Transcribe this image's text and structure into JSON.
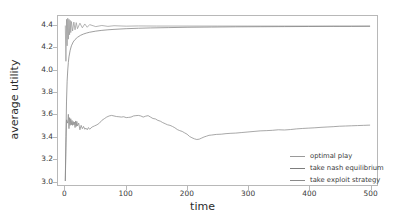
{
  "chart_data": {
    "type": "line",
    "title": "",
    "xlabel": "time",
    "ylabel": "average utility",
    "xlim": [
      -12,
      512
    ],
    "ylim": [
      2.96,
      4.49
    ],
    "xticks": [
      "0",
      "100",
      "200",
      "300",
      "400",
      "500"
    ],
    "xtick_values": [
      0,
      100,
      200,
      300,
      400,
      500
    ],
    "yticks": [
      "3.0",
      "3.2",
      "3.4",
      "3.6",
      "3.8",
      "4.0",
      "4.2",
      "4.4"
    ],
    "ytick_values": [
      3.0,
      3.2,
      3.4,
      3.6,
      3.8,
      4.0,
      4.2,
      4.4
    ],
    "grid": false,
    "legend_position": "lower right",
    "series": [
      {
        "name": "optimal play",
        "color": "#9a9a9a",
        "x": [
          0,
          1,
          2,
          3,
          4,
          5,
          6,
          7,
          8,
          9,
          10,
          12,
          14,
          16,
          18,
          20,
          24,
          28,
          32,
          36,
          40,
          50,
          60,
          70,
          80,
          100,
          120,
          150,
          200,
          250,
          300,
          350,
          400,
          450,
          500
        ],
        "y": [
          4.4,
          4.08,
          4.46,
          4.22,
          4.47,
          4.28,
          4.46,
          4.32,
          4.45,
          4.34,
          4.44,
          4.355,
          4.435,
          4.365,
          4.43,
          4.375,
          4.425,
          4.383,
          4.418,
          4.388,
          4.412,
          4.394,
          4.404,
          4.396,
          4.402,
          4.398,
          4.4,
          4.399,
          4.399,
          4.399,
          4.399,
          4.399,
          4.399,
          4.399,
          4.399
        ]
      },
      {
        "name": "take nash equilibrium",
        "color": "#7d7d7d",
        "x": [
          0,
          1,
          2,
          3,
          4,
          5,
          6,
          8,
          10,
          13,
          16,
          20,
          25,
          30,
          35,
          40,
          50,
          60,
          70,
          80,
          100,
          120,
          140,
          170,
          200,
          240,
          280,
          320,
          360,
          400,
          440,
          470,
          500
        ],
        "y": [
          3.0,
          3.4,
          3.72,
          3.9,
          4.0,
          4.07,
          4.12,
          4.18,
          4.22,
          4.255,
          4.277,
          4.297,
          4.315,
          4.327,
          4.336,
          4.343,
          4.353,
          4.36,
          4.365,
          4.369,
          4.375,
          4.379,
          4.382,
          4.385,
          4.388,
          4.39,
          4.392,
          4.393,
          4.394,
          4.395,
          4.396,
          4.396,
          4.397
        ]
      },
      {
        "name": "take exploit strategy",
        "color": "#8a8a8a",
        "x": [
          0,
          2,
          4,
          5,
          6,
          7,
          8,
          9,
          10,
          11,
          12,
          13,
          14,
          15,
          16,
          17,
          18,
          19,
          20,
          22,
          24,
          26,
          28,
          30,
          32,
          34,
          36,
          38,
          40,
          44,
          48,
          52,
          56,
          60,
          64,
          68,
          72,
          76,
          80,
          84,
          88,
          92,
          96,
          100,
          104,
          108,
          112,
          116,
          120,
          124,
          128,
          132,
          136,
          140,
          144,
          148,
          152,
          156,
          160,
          164,
          168,
          172,
          176,
          180,
          184,
          188,
          192,
          196,
          200,
          204,
          208,
          212,
          216,
          220,
          224,
          228,
          232,
          236,
          240,
          248,
          256,
          264,
          272,
          280,
          290,
          300,
          310,
          320,
          330,
          340,
          350,
          360,
          370,
          380,
          390,
          400,
          410,
          420,
          430,
          440,
          450,
          460,
          470,
          480,
          490,
          500
        ],
        "y": [
          3.0,
          3.55,
          3.52,
          3.6,
          3.47,
          3.57,
          3.5,
          3.56,
          3.505,
          3.545,
          3.5,
          3.535,
          3.505,
          3.53,
          3.48,
          3.54,
          3.49,
          3.535,
          3.495,
          3.52,
          3.46,
          3.5,
          3.47,
          3.49,
          3.465,
          3.475,
          3.46,
          3.48,
          3.465,
          3.485,
          3.495,
          3.505,
          3.52,
          3.545,
          3.56,
          3.575,
          3.585,
          3.59,
          3.585,
          3.58,
          3.578,
          3.575,
          3.578,
          3.57,
          3.572,
          3.575,
          3.585,
          3.588,
          3.59,
          3.585,
          3.575,
          3.583,
          3.588,
          3.575,
          3.562,
          3.558,
          3.545,
          3.538,
          3.525,
          3.515,
          3.505,
          3.5,
          3.49,
          3.478,
          3.462,
          3.452,
          3.445,
          3.432,
          3.42,
          3.4,
          3.388,
          3.378,
          3.372,
          3.375,
          3.385,
          3.395,
          3.402,
          3.41,
          3.412,
          3.418,
          3.42,
          3.425,
          3.428,
          3.43,
          3.435,
          3.44,
          3.445,
          3.45,
          3.452,
          3.455,
          3.46,
          3.458,
          3.462,
          3.468,
          3.472,
          3.475,
          3.478,
          3.482,
          3.485,
          3.488,
          3.492,
          3.494,
          3.496,
          3.498,
          3.5,
          3.502
        ]
      }
    ]
  },
  "legend": {
    "items": [
      {
        "label": "optimal play"
      },
      {
        "label": "take nash equilibrium"
      },
      {
        "label": "take exploit strategy"
      }
    ]
  }
}
